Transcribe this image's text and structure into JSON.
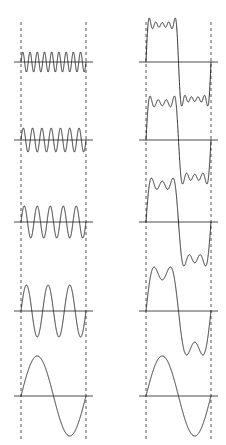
{
  "figure": {
    "background_color": "#ffffff",
    "wave_color": "#1a1a1a",
    "axis_color": "#4d4d4d",
    "guide_color": "#555555"
  },
  "chart_data": {
    "type": "line",
    "xlabel": "",
    "ylabel": "",
    "xlim": [
      0,
      6.283185307179586
    ],
    "grid": false,
    "legend": "none",
    "panel_count": 10,
    "columns": [
      {
        "name": "harmonic-components",
        "column_index": 0,
        "x_axis_start_px": 21,
        "x_axis_end_px": 86,
        "description": "Individual terms sin(n*x)/n of the square wave Fourier series"
      },
      {
        "name": "partial-sums",
        "column_index": 1,
        "x_axis_start_px": 146,
        "x_axis_end_px": 211,
        "description": "Cumulative partial sums of the square wave Fourier series"
      }
    ],
    "rows": [
      {
        "row_index": 0,
        "baseline_y_px": 62,
        "left": {
          "label": "harmonic n = 9",
          "harmonic": 9,
          "amplitude": 0.1111,
          "cycles": 9,
          "expression": "sin(9x)/9",
          "terms": [
            9
          ],
          "half_height_px": 10
        },
        "right": {
          "label": "partial sum n = 1,3,5,7,9",
          "terms": [
            1,
            3,
            5,
            7,
            9
          ],
          "expression": "sin(x) + sin(3x)/3 + sin(5x)/5 + sin(7x)/7 + sin(9x)/9",
          "half_height_px": 44
        }
      },
      {
        "row_index": 1,
        "baseline_y_px": 140,
        "left": {
          "label": "harmonic n = 7",
          "harmonic": 7,
          "amplitude": 0.1429,
          "cycles": 7,
          "expression": "sin(7x)/7",
          "terms": [
            7
          ],
          "half_height_px": 12
        },
        "right": {
          "label": "partial sum n = 1,3,5,7",
          "terms": [
            1,
            3,
            5,
            7
          ],
          "expression": "sin(x) + sin(3x)/3 + sin(5x)/5 + sin(7x)/7",
          "half_height_px": 44
        }
      },
      {
        "row_index": 2,
        "baseline_y_px": 222,
        "left": {
          "label": "harmonic n = 5",
          "harmonic": 5,
          "amplitude": 0.2,
          "cycles": 5,
          "expression": "sin(5x)/5",
          "terms": [
            5
          ],
          "half_height_px": 16
        },
        "right": {
          "label": "partial sum n = 1,3,5",
          "terms": [
            1,
            3,
            5
          ],
          "expression": "sin(x) + sin(3x)/3 + sin(5x)/5",
          "half_height_px": 44
        }
      },
      {
        "row_index": 3,
        "baseline_y_px": 311,
        "left": {
          "label": "harmonic n = 3",
          "harmonic": 3,
          "amplitude": 0.3333,
          "cycles": 3,
          "expression": "sin(3x)/3",
          "terms": [
            3
          ],
          "half_height_px": 26
        },
        "right": {
          "label": "partial sum n = 1,3",
          "terms": [
            1,
            3
          ],
          "expression": "sin(x) + sin(3x)/3",
          "half_height_px": 44
        }
      },
      {
        "row_index": 4,
        "baseline_y_px": 396,
        "left": {
          "label": "harmonic n = 1",
          "harmonic": 1,
          "amplitude": 1.0,
          "cycles": 1,
          "expression": "sin(x)",
          "terms": [
            1
          ],
          "half_height_px": 40
        },
        "right": {
          "label": "partial sum n = 1",
          "terms": [
            1
          ],
          "expression": "sin(x)",
          "half_height_px": 40
        }
      }
    ],
    "guides": [
      {
        "name": "left-guide-start",
        "x_px": 21,
        "y_top_px": 22,
        "y_bottom_px": 440
      },
      {
        "name": "left-guide-end",
        "x_px": 86,
        "y_top_px": 22,
        "y_bottom_px": 440
      },
      {
        "name": "right-guide-start",
        "x_px": 146,
        "y_top_px": 22,
        "y_bottom_px": 440
      },
      {
        "name": "right-guide-end",
        "x_px": 211,
        "y_top_px": 22,
        "y_bottom_px": 440
      }
    ]
  }
}
